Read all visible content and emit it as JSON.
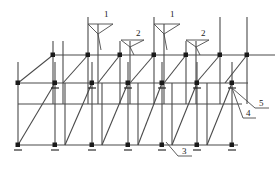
{
  "diagram": {
    "type": "scaffolding-axonometric",
    "title": "",
    "stroke_color": "#4a4a4a",
    "node_color": "#1a1a1a",
    "leader_color": "#4a4a4a",
    "background": "#ffffff",
    "width": 278,
    "height": 169
  },
  "callouts": [
    {
      "id": "callout-1a",
      "label": "1",
      "x": 104,
      "y": 10
    },
    {
      "id": "callout-2a",
      "label": "2",
      "x": 136,
      "y": 29
    },
    {
      "id": "callout-1b",
      "label": "1",
      "x": 170,
      "y": 10
    },
    {
      "id": "callout-2b",
      "label": "2",
      "x": 201,
      "y": 29
    },
    {
      "id": "callout-3",
      "label": "3",
      "x": 182,
      "y": 148
    },
    {
      "id": "callout-4",
      "label": "4",
      "x": 247,
      "y": 122
    },
    {
      "id": "callout-5",
      "label": "5",
      "x": 259,
      "y": 111
    }
  ],
  "levels": {
    "top_ledger_label": "top ledger",
    "mid_ledger_label": "middle ledger",
    "base_ledger_label": "base ledger"
  },
  "parts": {
    "standard": "standard",
    "ledger": "ledger",
    "diagonal_brace": "diagonal-brace",
    "base_plate": "base-plate",
    "node": "node-joint"
  }
}
